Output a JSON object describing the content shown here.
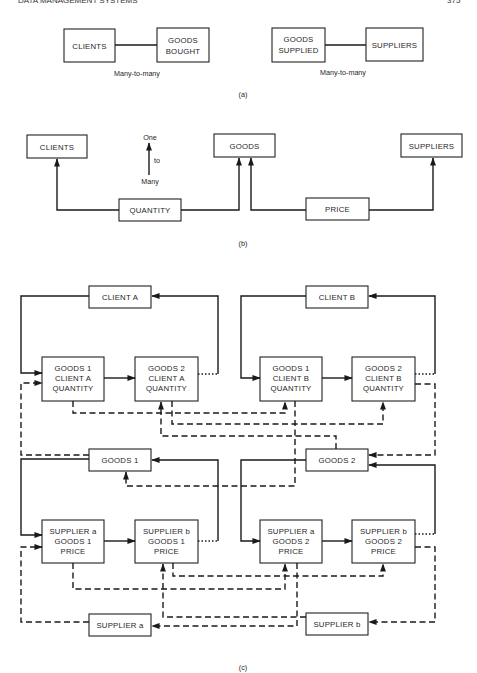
{
  "page_header": {
    "running_title": "DATA MANAGEMENT SYSTEMS",
    "page_number": "375"
  },
  "figure_a": {
    "caption": "(a)",
    "left": {
      "entity1": "CLIENTS",
      "entity2_line1": "GOODS",
      "entity2_line2": "BOUGHT",
      "relation": "Many-to-many"
    },
    "right": {
      "entity1_line1": "GOODS",
      "entity1_line2": "SUPPLIED",
      "entity2": "SUPPLIERS",
      "relation": "Many-to-many"
    }
  },
  "figure_b": {
    "caption": "(b)",
    "boxes": {
      "clients": "CLIENTS",
      "goods": "GOODS",
      "suppliers": "SUPPLIERS",
      "quantity": "QUANTITY",
      "price": "PRICE"
    },
    "legend": {
      "top": "One",
      "middle": "to",
      "bottom": "Many"
    }
  },
  "figure_c": {
    "caption": "(c)",
    "clients": {
      "a": "CLIENT A",
      "b": "CLIENT B"
    },
    "goods": {
      "g1": "GOODS 1",
      "g2": "GOODS 2"
    },
    "suppliers": {
      "a": "SUPPLIER a",
      "b": "SUPPLIER b"
    },
    "quantity_records": [
      {
        "line1": "GOODS 1",
        "line2": "CLIENT A",
        "line3": "QUANTITY"
      },
      {
        "line1": "GOODS 2",
        "line2": "CLIENT A",
        "line3": "QUANTITY"
      },
      {
        "line1": "GOODS 1",
        "line2": "CLIENT B",
        "line3": "QUANTITY"
      },
      {
        "line1": "GOODS 2",
        "line2": "CLIENT B",
        "line3": "QUANTITY"
      }
    ],
    "price_records": [
      {
        "line1": "SUPPLIER a",
        "line2": "GOODS 1",
        "line3": "PRICE"
      },
      {
        "line1": "SUPPLIER b",
        "line2": "GOODS 1",
        "line3": "PRICE"
      },
      {
        "line1": "SUPPLIER a",
        "line2": "GOODS 2",
        "line3": "PRICE"
      },
      {
        "line1": "SUPPLIER b",
        "line2": "GOODS 2",
        "line3": "PRICE"
      }
    ]
  }
}
